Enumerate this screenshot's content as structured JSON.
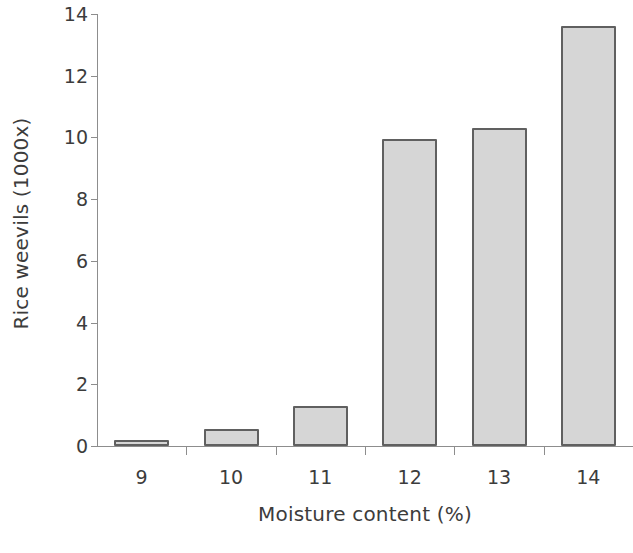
{
  "chart_data": {
    "type": "bar",
    "title": "",
    "xlabel": "Moisture content (%)",
    "ylabel": "Rice weevils (1000x)",
    "categories": [
      "9",
      "10",
      "11",
      "12",
      "13",
      "14"
    ],
    "values": [
      0.2,
      0.55,
      1.3,
      9.95,
      10.3,
      13.6
    ],
    "ylim": [
      0,
      14
    ],
    "yticks": [
      0,
      2,
      4,
      6,
      8,
      10,
      12,
      14
    ],
    "ytick_labels": [
      "0",
      "2",
      "4",
      "6",
      "8",
      "10",
      "12",
      "14"
    ],
    "grid": false,
    "legend": false,
    "bar_fill_color": "#d6d6d6",
    "bar_edge_color": "#606060",
    "axis_color": "#8d8d8d",
    "text_color": "#3c3c3c"
  }
}
